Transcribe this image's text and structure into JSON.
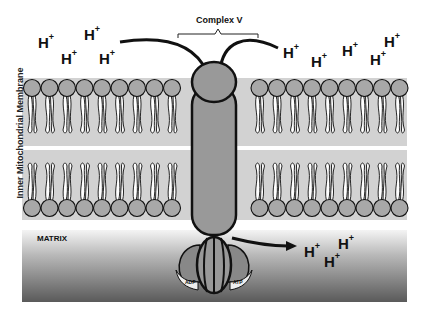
{
  "title": "Complex V",
  "membrane_label": "Inner Mitochondrial Membrane",
  "matrix_label": "MATRIX",
  "adp_label": "ADP",
  "atp_label": "ATP",
  "protons_intermembrane": [
    {
      "text": "H",
      "sup": "+",
      "x": 38,
      "y": 34
    },
    {
      "text": "H",
      "sup": "+",
      "x": 84,
      "y": 26
    },
    {
      "text": "H",
      "sup": "+",
      "x": 61,
      "y": 50
    },
    {
      "text": "H",
      "sup": "+",
      "x": 99,
      "y": 50
    },
    {
      "text": "H",
      "sup": "+",
      "x": 283,
      "y": 44
    },
    {
      "text": "H",
      "sup": "+",
      "x": 311,
      "y": 53
    },
    {
      "text": "H",
      "sup": "+",
      "x": 342,
      "y": 42
    },
    {
      "text": "H",
      "sup": "+",
      "x": 384,
      "y": 33
    },
    {
      "text": "H",
      "sup": "+",
      "x": 370,
      "y": 51
    }
  ],
  "protons_matrix": [
    {
      "text": "H",
      "sup": "+",
      "x": 304,
      "y": 243
    },
    {
      "text": "H",
      "sup": "+",
      "x": 338,
      "y": 235
    },
    {
      "text": "H",
      "sup": "+",
      "x": 324,
      "y": 253
    }
  ],
  "colors": {
    "membrane_bg": "#d0d0d0",
    "lipid_head": "#a8a8a8",
    "protein": "#999999",
    "outline": "#111111"
  }
}
